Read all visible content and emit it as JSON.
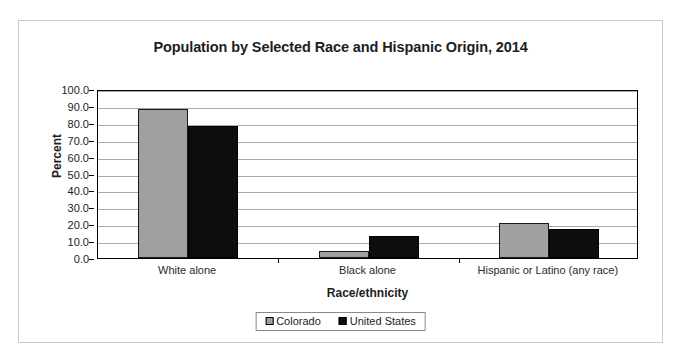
{
  "chart_data": {
    "type": "bar",
    "title": "Population by Selected Race and Hispanic Origin, 2014",
    "xlabel": "Race/ethnicity",
    "ylabel": "Percent",
    "ylim": [
      0,
      100
    ],
    "ytick_step": 10,
    "ytick_labels": [
      "0.0",
      "10.0",
      "20.0",
      "30.0",
      "40.0",
      "50.0",
      "60.0",
      "70.0",
      "80.0",
      "90.0",
      "100.0"
    ],
    "grid": true,
    "legend_position": "bottom",
    "categories": [
      "White alone",
      "Black alone",
      "Hispanic or Latino (any race)"
    ],
    "series": [
      {
        "name": "Colorado",
        "color": "#a0a0a0",
        "values": [
          88.0,
          4.0,
          21.0
        ]
      },
      {
        "name": "United States",
        "color": "#0d0d0d",
        "values": [
          78.0,
          13.0,
          17.0
        ]
      }
    ]
  },
  "page": {
    "top_sliver_text": ""
  }
}
